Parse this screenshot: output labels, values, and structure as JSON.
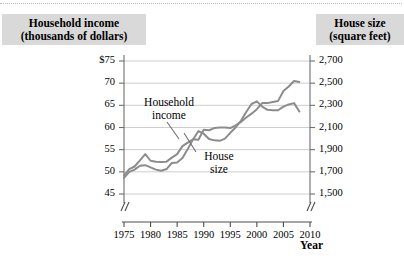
{
  "figure": {
    "left_axis_title": "Household income\n(thousands of dollars)",
    "left_axis_title_line1": "Household income",
    "left_axis_title_line2": "(thousands of dollars)",
    "right_axis_title_line1": "House size",
    "right_axis_title_line2": "(square feet)",
    "xaxis_title": "Year",
    "series_label_household_line1": "Household",
    "series_label_household_line2": "income",
    "series_label_house_line1": "House",
    "series_label_house_line2": "size",
    "colors": {
      "line": "#8c8c8c",
      "grid": "#c8c8c8",
      "axis": "#6e6e6e",
      "title_band": "#d9d9d9",
      "background": "#ffffff"
    }
  },
  "chart_data": {
    "type": "line",
    "title": "",
    "subtitle": "",
    "xlabel": "Year",
    "ylabel": "Household income (thousands of dollars)",
    "y2label": "House size (square feet)",
    "grid": true,
    "legend": "inline-annotations",
    "xlim": [
      1975,
      2010
    ],
    "xticks": [
      1975,
      1980,
      1985,
      1990,
      1995,
      2000,
      2005,
      2010
    ],
    "xtick_labels": [
      "1975",
      "1980",
      "1985",
      "1990",
      "1995",
      "2000",
      "2005",
      "2010"
    ],
    "ylim": [
      45,
      75
    ],
    "yticks": [
      45,
      50,
      55,
      60,
      65,
      70,
      75
    ],
    "ytick_labels": [
      "45",
      "50",
      "55",
      "60",
      "65",
      "70",
      "$75"
    ],
    "y2lim": [
      1500,
      2700
    ],
    "y2ticks": [
      1500,
      1700,
      1900,
      2100,
      2300,
      2500,
      2700
    ],
    "y2tick_labels": [
      "1,500",
      "1,700",
      "1,900",
      "2,100",
      "2,300",
      "2,500",
      "2,700"
    ],
    "axis_breaks": [
      "x-axis left of 1975",
      "x-axis right of 2008",
      "y-axis below 45"
    ],
    "series": [
      {
        "name": "Household income",
        "axis": "left",
        "units": "thousands of dollars",
        "x": [
          1975,
          1976,
          1977,
          1978,
          1979,
          1980,
          1981,
          1982,
          1983,
          1984,
          1985,
          1986,
          1987,
          1988,
          1989,
          1990,
          1991,
          1992,
          1993,
          1994,
          1995,
          1996,
          1997,
          1998,
          1999,
          2000,
          2001,
          2002,
          2003,
          2004,
          2005,
          2006,
          2007,
          2008
        ],
        "values": [
          49.2,
          50.6,
          51.2,
          52.6,
          54.0,
          52.5,
          52.3,
          52.2,
          52.3,
          53.2,
          54.0,
          55.8,
          56.6,
          57.3,
          59.2,
          58.6,
          57.4,
          57.1,
          57.0,
          57.5,
          58.8,
          60.0,
          61.5,
          63.5,
          65.3,
          65.9,
          64.7,
          64.0,
          63.9,
          63.9,
          64.7,
          65.2,
          65.5,
          63.6
        ]
      },
      {
        "name": "House size",
        "axis": "right",
        "units": "square feet",
        "x": [
          1975,
          1976,
          1977,
          1978,
          1979,
          1980,
          1981,
          1982,
          1983,
          1984,
          1985,
          1986,
          1987,
          1988,
          1989,
          1990,
          1991,
          1992,
          1993,
          1994,
          1995,
          1996,
          1997,
          1998,
          1999,
          2000,
          2001,
          2002,
          2003,
          2004,
          2005,
          2006,
          2007,
          2008
        ],
        "values": [
          1645,
          1700,
          1720,
          1755,
          1760,
          1740,
          1720,
          1710,
          1725,
          1780,
          1785,
          1825,
          1905,
          1995,
          1990,
          2080,
          2075,
          2095,
          2100,
          2100,
          2095,
          2120,
          2150,
          2190,
          2225,
          2265,
          2320,
          2320,
          2330,
          2340,
          2430,
          2470,
          2520,
          2510
        ]
      }
    ],
    "annotations": [
      {
        "text": "Household income",
        "points_to_series": "Household income",
        "at_year": 1988
      },
      {
        "text": "House size",
        "points_to_series": "House size",
        "at_year": 1990
      }
    ]
  }
}
